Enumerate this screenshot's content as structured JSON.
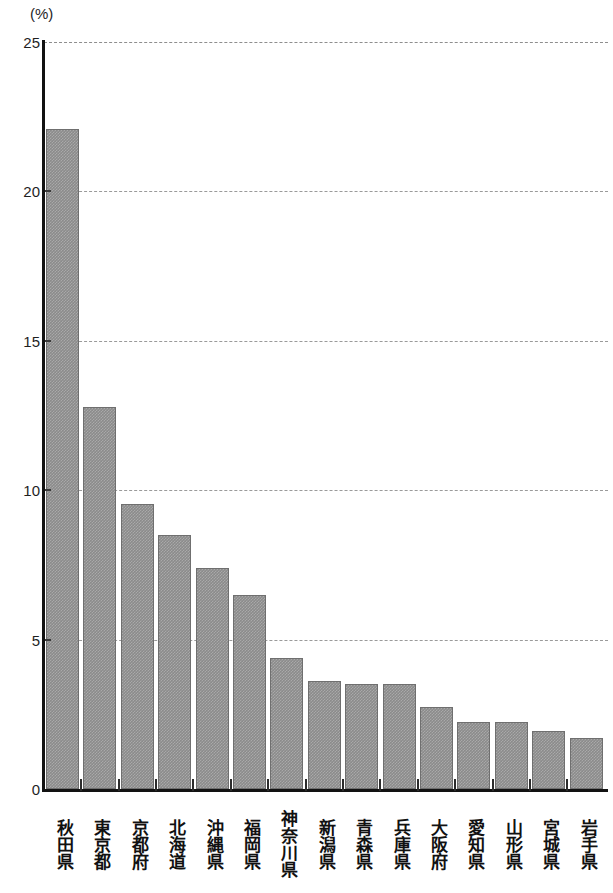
{
  "chart_data": {
    "type": "bar",
    "title": "",
    "subtitle": "",
    "xlabel": "",
    "ylabel": "",
    "unit_label": "(%)",
    "ylim": [
      0,
      25
    ],
    "yticks": [
      0,
      5,
      10,
      15,
      20,
      25
    ],
    "ytick_labels": [
      "0",
      "5",
      "10",
      "15",
      "20",
      "25"
    ],
    "grid": true,
    "grid_axis": "y",
    "grid_style": "dashed",
    "legend": false,
    "orientation": "vertical",
    "bar_color": "#8b8b8b",
    "categories": [
      "秋田県",
      "東京都",
      "京都府",
      "北海道",
      "沖縄県",
      "福岡県",
      "神奈川県",
      "新潟県",
      "青森県",
      "兵庫県",
      "大阪府",
      "愛知県",
      "山形県",
      "宮城県",
      "岩手県"
    ],
    "values": [
      22.1,
      12.8,
      9.55,
      8.5,
      7.4,
      6.5,
      4.4,
      3.6,
      3.5,
      3.5,
      2.75,
      2.25,
      2.25,
      1.95,
      1.7
    ]
  },
  "axis": {
    "unit_label": "(%)"
  }
}
